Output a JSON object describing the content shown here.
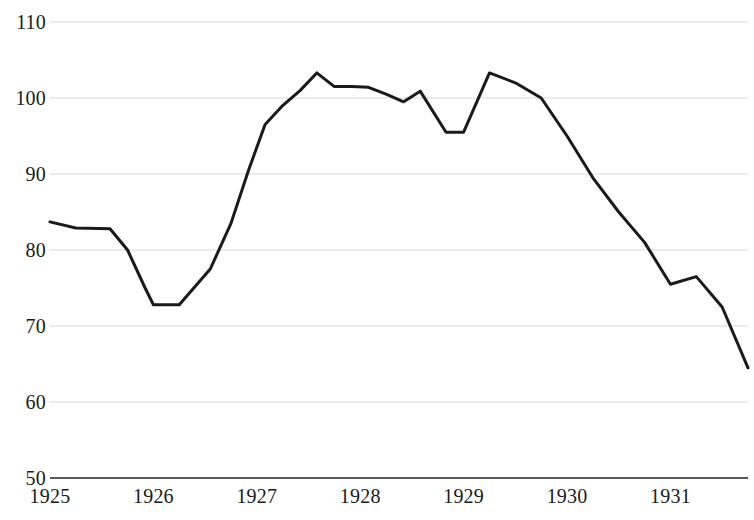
{
  "chart_data": {
    "type": "line",
    "title": "",
    "subtitle": "",
    "xlabel": "",
    "ylabel": "",
    "xlim": [
      1925.0,
      1931.75
    ],
    "ylim": [
      50,
      110
    ],
    "yticks": [
      50,
      60,
      70,
      80,
      90,
      100,
      110
    ],
    "ytick_labels": [
      "50",
      "60",
      "70",
      "80",
      "90",
      "100",
      "110"
    ],
    "xticks": [
      1925,
      1926,
      1927,
      1928,
      1929,
      1930,
      1931
    ],
    "xtick_labels": [
      "1925",
      "1926",
      "1927",
      "1928",
      "1929",
      "1930",
      "1931"
    ],
    "grid": true,
    "grid_axis": "y",
    "grid_color": "#d9d9d9",
    "axis_color": "#595959",
    "legend": null,
    "legend_position": "none",
    "series": [
      {
        "name": "series-1",
        "color": "#1a1a1a",
        "line_width": 3,
        "markers": false,
        "x": [
          1925.0,
          1925.25,
          1925.58,
          1925.75,
          1925.92,
          1926.0,
          1926.25,
          1926.55,
          1926.75,
          1926.92,
          1927.08,
          1927.25,
          1927.42,
          1927.58,
          1927.75,
          1927.92,
          1928.08,
          1928.25,
          1928.42,
          1928.58,
          1928.83,
          1929.0,
          1929.25,
          1929.5,
          1929.75,
          1930.0,
          1930.25,
          1930.5,
          1930.75,
          1931.0,
          1931.25,
          1931.5,
          1931.75
        ],
        "y": [
          83.7,
          82.9,
          82.8,
          80.0,
          75.0,
          72.8,
          72.8,
          77.5,
          83.5,
          90.5,
          96.5,
          99.0,
          101.0,
          103.3,
          101.5,
          101.5,
          101.4,
          100.5,
          99.5,
          100.9,
          95.5,
          95.5,
          103.3,
          102.0,
          100.0,
          95.0,
          89.5,
          85.0,
          81.0,
          75.5,
          76.5,
          72.5,
          64.5
        ]
      }
    ]
  },
  "axes": {
    "y_axis_name": "value-axis",
    "x_axis_name": "year-axis"
  }
}
